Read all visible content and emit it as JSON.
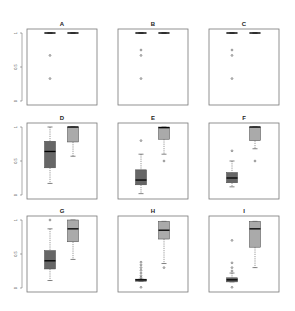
{
  "chart_data": {
    "type": "box",
    "layout": {
      "rows": 3,
      "cols": 3
    },
    "colors": {
      "group1_fill": "#666666",
      "group2_fill": "#aaaaaa",
      "median": "#000000",
      "frame": "#777777"
    },
    "ylim": [
      0,
      1
    ],
    "yticks": [
      "0",
      "0.5",
      "1"
    ],
    "panels": [
      {
        "title": "A",
        "show_yaxis": true,
        "boxes": [
          {
            "whisker_low": 1.0,
            "q1": 1.0,
            "median": 1.0,
            "q3": 1.0,
            "whisker_high": 1.0,
            "outliers": [
              0.67,
              0.33
            ]
          },
          {
            "whisker_low": 1.0,
            "q1": 1.0,
            "median": 1.0,
            "q3": 1.0,
            "whisker_high": 1.0,
            "outliers": []
          }
        ]
      },
      {
        "title": "B",
        "show_yaxis": false,
        "boxes": [
          {
            "whisker_low": 1.0,
            "q1": 1.0,
            "median": 1.0,
            "q3": 1.0,
            "whisker_high": 1.0,
            "outliers": [
              0.75,
              0.67,
              0.33
            ]
          },
          {
            "whisker_low": 1.0,
            "q1": 1.0,
            "median": 1.0,
            "q3": 1.0,
            "whisker_high": 1.0,
            "outliers": []
          }
        ]
      },
      {
        "title": "C",
        "show_yaxis": false,
        "boxes": [
          {
            "whisker_low": 1.0,
            "q1": 1.0,
            "median": 1.0,
            "q3": 1.0,
            "whisker_high": 1.0,
            "outliers": [
              0.75,
              0.67,
              0.33
            ]
          },
          {
            "whisker_low": 1.0,
            "q1": 1.0,
            "median": 1.0,
            "q3": 1.0,
            "whisker_high": 1.0,
            "outliers": []
          }
        ]
      },
      {
        "title": "D",
        "show_yaxis": true,
        "boxes": [
          {
            "whisker_low": 0.17,
            "q1": 0.4,
            "median": 0.64,
            "q3": 0.79,
            "whisker_high": 1.0,
            "outliers": []
          },
          {
            "whisker_low": 0.57,
            "q1": 0.78,
            "median": 1.0,
            "q3": 1.0,
            "whisker_high": 1.0,
            "outliers": []
          }
        ]
      },
      {
        "title": "E",
        "show_yaxis": false,
        "boxes": [
          {
            "whisker_low": 0.02,
            "q1": 0.15,
            "median": 0.22,
            "q3": 0.37,
            "whisker_high": 0.6,
            "outliers": [
              0.8
            ]
          },
          {
            "whisker_low": 0.6,
            "q1": 0.82,
            "median": 0.99,
            "q3": 1.0,
            "whisker_high": 1.0,
            "outliers": [
              0.5
            ]
          }
        ]
      },
      {
        "title": "F",
        "show_yaxis": false,
        "boxes": [
          {
            "whisker_low": 0.12,
            "q1": 0.18,
            "median": 0.25,
            "q3": 0.33,
            "whisker_high": 0.5,
            "outliers": [
              0.65
            ]
          },
          {
            "whisker_low": 0.68,
            "q1": 0.8,
            "median": 1.0,
            "q3": 1.0,
            "whisker_high": 1.0,
            "outliers": [
              0.5
            ]
          }
        ]
      },
      {
        "title": "G",
        "show_yaxis": true,
        "boxes": [
          {
            "whisker_low": 0.11,
            "q1": 0.28,
            "median": 0.4,
            "q3": 0.55,
            "whisker_high": 0.87,
            "outliers": [
              1.0
            ]
          },
          {
            "whisker_low": 0.42,
            "q1": 0.68,
            "median": 0.87,
            "q3": 1.0,
            "whisker_high": 1.0,
            "outliers": []
          }
        ]
      },
      {
        "title": "H",
        "show_yaxis": false,
        "boxes": [
          {
            "whisker_low": 0.1,
            "q1": 0.1,
            "median": 0.12,
            "q3": 0.13,
            "whisker_high": 0.13,
            "outliers": [
              0.38,
              0.34,
              0.3,
              0.26,
              0.22,
              0.18,
              0.15,
              0.01
            ]
          },
          {
            "whisker_low": 0.36,
            "q1": 0.72,
            "median": 0.85,
            "q3": 0.98,
            "whisker_high": 0.98,
            "outliers": [
              0.3
            ]
          }
        ]
      },
      {
        "title": "I",
        "show_yaxis": false,
        "boxes": [
          {
            "whisker_low": 0.09,
            "q1": 0.09,
            "median": 0.12,
            "q3": 0.15,
            "whisker_high": 0.22,
            "outliers": [
              0.7,
              0.37,
              0.3,
              0.25,
              0.01
            ]
          },
          {
            "whisker_low": 0.3,
            "q1": 0.6,
            "median": 0.87,
            "q3": 0.98,
            "whisker_high": 0.98,
            "outliers": []
          }
        ]
      }
    ]
  }
}
